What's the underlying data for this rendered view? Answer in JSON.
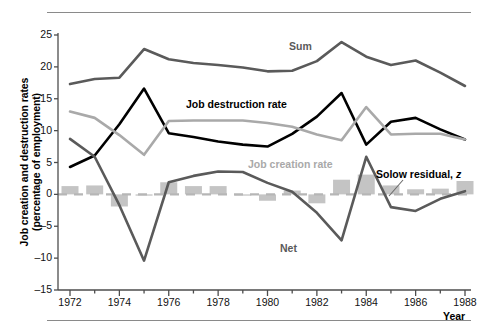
{
  "chart_data": {
    "type": "line",
    "title": "",
    "xlabel": "Year",
    "ylabel": "Job creation and destruction rates (percentage of employment)",
    "x": [
      1972,
      1973,
      1974,
      1975,
      1976,
      1977,
      1978,
      1979,
      1980,
      1981,
      1982,
      1983,
      1984,
      1985,
      1986,
      1987,
      1988
    ],
    "xlim": [
      1971.4,
      1988.6
    ],
    "ylim": [
      -15,
      25
    ],
    "yticks": [
      -15,
      -10,
      -5,
      0,
      5,
      10,
      15,
      20,
      25
    ],
    "xticks": [
      1972,
      1974,
      1976,
      1978,
      1980,
      1982,
      1984,
      1986,
      1988
    ],
    "xtick_labels": [
      "1972",
      "1974",
      "1976",
      "1978",
      "1980",
      "1982",
      "1984",
      "1986",
      "1988"
    ],
    "ytick_labels": [
      "-15",
      "-10",
      "-5",
      "0",
      "5",
      "10",
      "15",
      "20",
      "25"
    ],
    "grid": false,
    "legend": "inline-annotations",
    "series": [
      {
        "name": "Sum",
        "color": "#5a5a5a",
        "kind": "line",
        "values": [
          17.3,
          18.1,
          18.3,
          22.8,
          21.2,
          20.6,
          20.3,
          19.9,
          19.3,
          19.4,
          20.9,
          23.9,
          21.6,
          20.3,
          21.0,
          19.1,
          17.0
        ]
      },
      {
        "name": "Job destruction rate",
        "color": "#000000",
        "kind": "line",
        "values": [
          4.3,
          6.1,
          11.0,
          16.6,
          9.6,
          9.0,
          8.3,
          7.8,
          7.5,
          9.5,
          12.2,
          15.9,
          7.8,
          11.4,
          12.0,
          10.2,
          8.6
        ]
      },
      {
        "name": "Job creation rate",
        "color": "#a9a9a9",
        "kind": "line",
        "values": [
          13.0,
          12.0,
          9.3,
          6.2,
          11.5,
          11.6,
          11.6,
          11.6,
          11.2,
          10.6,
          9.4,
          8.5,
          13.7,
          9.4,
          9.5,
          9.5,
          8.6
        ]
      },
      {
        "name": "Net",
        "color": "#5a5a5a",
        "kind": "line",
        "values": [
          8.7,
          5.9,
          -1.7,
          -10.4,
          1.9,
          2.9,
          3.6,
          3.5,
          1.8,
          0.4,
          -2.9,
          -7.2,
          5.9,
          -2.0,
          -2.6,
          -0.7,
          0.5
        ]
      },
      {
        "name": "Solow residual, z",
        "color": "#c4c4c4",
        "kind": "bar",
        "values": [
          1.3,
          1.4,
          -1.9,
          -0.2,
          1.9,
          1.3,
          1.3,
          -0.2,
          -1.0,
          0.6,
          -1.4,
          2.3,
          3.1,
          1.4,
          0.8,
          0.9,
          2.1
        ]
      }
    ],
    "annotations": [
      {
        "text": "Sum",
        "series": "Sum",
        "color": "#5a5a5a"
      },
      {
        "text": "Job destruction rate",
        "series": "Job destruction rate",
        "color": "#000000"
      },
      {
        "text": "Job creation rate",
        "series": "Job creation rate",
        "color": "#a9a9a9"
      },
      {
        "text": "Net",
        "series": "Net",
        "color": "#5a5a5a"
      },
      {
        "text": "Solow residual, z",
        "series": "Solow residual, z",
        "color": "#000000"
      }
    ]
  }
}
